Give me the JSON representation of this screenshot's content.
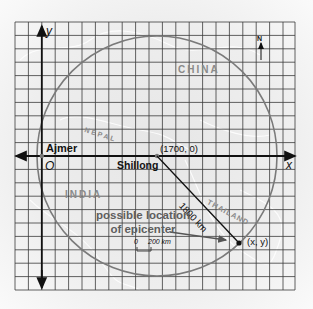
{
  "diagram": {
    "axes": {
      "x_label": "x",
      "y_label": "y",
      "origin_label": "O"
    },
    "places": {
      "ajmer": "Ajmer",
      "shillong": "Shillong",
      "shillong_coords": "(1700, 0)",
      "epicenter_coords": "(x, y)"
    },
    "countries": {
      "china": "CHINA",
      "nepal": "NEPAL",
      "india": "INDIA",
      "thailand": "THAILAND"
    },
    "distance_label": "1800 km",
    "annotation": {
      "line1": "possible location",
      "line2": "of epicenter"
    },
    "scale": {
      "zero": "0",
      "value": "200 km"
    },
    "compass": "N",
    "colors": {
      "grid": "#3a3a3a",
      "circle": "#7a7a7a",
      "axis": "#111111",
      "background": "#e9e9e9"
    }
  }
}
